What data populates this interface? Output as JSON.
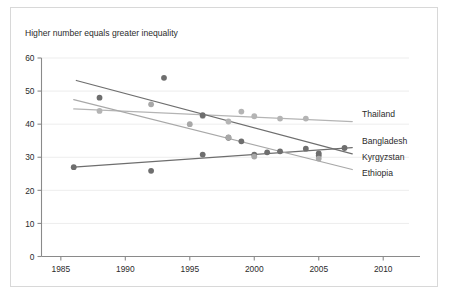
{
  "chart_data": {
    "type": "scatter",
    "title": "Higher number equals greater inequality",
    "xlabel": "",
    "ylabel": "",
    "xlim": [
      1983.5,
      2012.0
    ],
    "ylim": [
      0,
      60
    ],
    "xticks": [
      1985,
      1990,
      1995,
      2000,
      2005,
      2010
    ],
    "yticks": [
      0,
      10,
      20,
      30,
      40,
      50,
      60
    ],
    "grid": true,
    "grid_axis": "y",
    "legend_position": "right-inline-labels",
    "series": [
      {
        "name": "Thailand",
        "color": "#b4b4b4",
        "points": [
          {
            "x": 1988,
            "y": 44
          },
          {
            "x": 1996,
            "y": 42.5
          },
          {
            "x": 1998,
            "y": 40.8
          },
          {
            "x": 1999,
            "y": 43.8
          },
          {
            "x": 2000,
            "y": 42.4
          },
          {
            "x": 2002,
            "y": 41.7
          },
          {
            "x": 2004,
            "y": 41.7
          }
        ],
        "trend": {
          "x1": 1986.0,
          "y1": 44.6,
          "x2": 2007.6,
          "y2": 40.8
        }
      },
      {
        "name": "Bangladesh",
        "color": "#6e6e6e",
        "points": [
          {
            "x": 1986,
            "y": 27.0
          },
          {
            "x": 1992,
            "y": 25.9
          },
          {
            "x": 1996,
            "y": 30.8
          },
          {
            "x": 2000,
            "y": 30.8
          },
          {
            "x": 2002,
            "y": 31.8
          },
          {
            "x": 2004,
            "y": 32.6
          },
          {
            "x": 2005,
            "y": 31.2
          },
          {
            "x": 2007,
            "y": 32.8
          }
        ],
        "trend": {
          "x1": 1986.0,
          "y1": 27.0,
          "x2": 2007.6,
          "y2": 32.9
        }
      },
      {
        "name": "Kyrgyzstan",
        "color": "#6e6e6e",
        "points": [
          {
            "x": 1988,
            "y": 48.0
          },
          {
            "x": 1993,
            "y": 54.0
          },
          {
            "x": 1996,
            "y": 42.7
          },
          {
            "x": 1998,
            "y": 35.9
          },
          {
            "x": 1999,
            "y": 34.8
          },
          {
            "x": 2001,
            "y": 31.5
          },
          {
            "x": 2005,
            "y": 30.5
          }
        ],
        "trend": {
          "x1": 1986.2,
          "y1": 53.2,
          "x2": 2007.6,
          "y2": 31.0
        }
      },
      {
        "name": "Ethiopia",
        "color": "#a8a8a8",
        "points": [
          {
            "x": 1992,
            "y": 46.0
          },
          {
            "x": 1995,
            "y": 40.0
          },
          {
            "x": 1998,
            "y": 36.0
          },
          {
            "x": 2000,
            "y": 30.2
          },
          {
            "x": 2005,
            "y": 29.6
          }
        ],
        "trend": {
          "x1": 1986.0,
          "y1": 47.4,
          "x2": 2007.6,
          "y2": 26.3
        }
      }
    ]
  }
}
